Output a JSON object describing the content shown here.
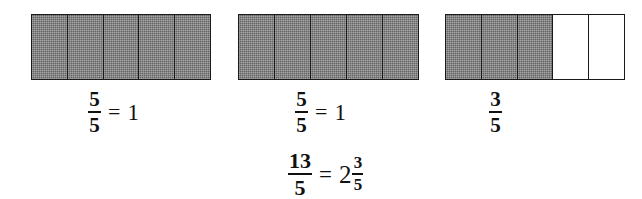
{
  "figure": {
    "colors": {
      "background": "#ffffff",
      "outline": "#1a1a1a",
      "shaded_cell": "#7e7e7e",
      "unshaded_cell": "#ffffff",
      "text": "#111111"
    }
  },
  "bars": [
    {
      "name": "bar-1",
      "total_cells": 5,
      "shaded_cells": 5,
      "cells": [
        "shaded",
        "shaded",
        "shaded",
        "shaded",
        "shaded"
      ]
    },
    {
      "name": "bar-2",
      "total_cells": 5,
      "shaded_cells": 5,
      "cells": [
        "shaded",
        "shaded",
        "shaded",
        "shaded",
        "shaded"
      ]
    },
    {
      "name": "bar-3",
      "total_cells": 5,
      "shaded_cells": 3,
      "cells": [
        "shaded",
        "shaded",
        "shaded",
        "unshaded",
        "unshaded"
      ]
    }
  ],
  "labels": [
    {
      "name": "label-1",
      "numerator": "5",
      "denominator": "5",
      "operator": "=",
      "result": "1"
    },
    {
      "name": "label-2",
      "numerator": "5",
      "denominator": "5",
      "operator": "=",
      "result": "1"
    },
    {
      "name": "label-3",
      "numerator": "3",
      "denominator": "5",
      "operator": "",
      "result": ""
    }
  ],
  "summary": {
    "name": "summary-equation",
    "left_numerator": "13",
    "left_denominator": "5",
    "operator": "=",
    "whole_number": "2",
    "right_numerator": "3",
    "right_denominator": "5"
  }
}
